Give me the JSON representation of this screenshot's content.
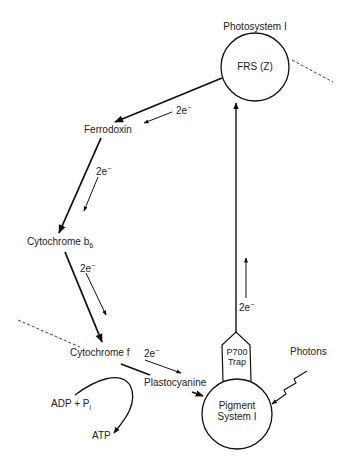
{
  "diagram": {
    "title": "Photosystem I",
    "nodes": {
      "frs": {
        "label": "FRS (Z)"
      },
      "ferrodoxin": {
        "label": "Ferrodoxin"
      },
      "cytochrome_b6": {
        "label": "Cytochrome b",
        "subscript": "6"
      },
      "cytochrome_f": {
        "label": "Cytochrome f"
      },
      "plastocyanine": {
        "label": "Plastocyanine"
      },
      "p700_trap": {
        "line1": "P700",
        "line2": "Trap"
      },
      "pigment_system": {
        "line1": "Pigment",
        "line2": "System I"
      },
      "photons": {
        "label": "Photons"
      },
      "adp": {
        "label": "ADP + P",
        "subscript": "i"
      },
      "atp": {
        "label": "ATP"
      }
    },
    "electron_labels": {
      "frs_to_ferrodoxin": {
        "text": "2e",
        "sup": "−"
      },
      "ferrodoxin_to_b6": {
        "text": "2e",
        "sup": "−"
      },
      "b6_to_f": {
        "text": "2e",
        "sup": "−"
      },
      "f_to_plastocyanine": {
        "text": "2e",
        "sup": "−"
      },
      "trap_to_frs": {
        "text": "2e",
        "sup": "−"
      }
    }
  }
}
